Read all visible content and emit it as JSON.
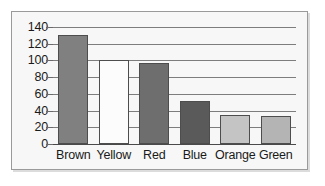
{
  "chart_data": {
    "type": "bar",
    "title": "",
    "subtitle": "",
    "xlabel": "",
    "ylabel": "",
    "categories": [
      "Brown",
      "Yellow",
      "Red",
      "Blue",
      "Orange",
      "Green"
    ],
    "values": [
      130,
      100,
      97,
      52,
      35,
      33
    ],
    "ylim": [
      0,
      140
    ],
    "yticks": [
      0,
      20,
      40,
      60,
      80,
      100,
      120,
      140
    ],
    "ytick_labels": [
      "0",
      "20",
      "40",
      "60",
      "80",
      "100",
      "120",
      "140"
    ],
    "grid": true,
    "grid_axis": "y",
    "legend": false,
    "legend_position": "none",
    "annotations": [],
    "bar_colors": [
      "#808080",
      "#fcfcfc",
      "#6e6e6e",
      "#5a5a5a",
      "#c4c4c4",
      "#b4b4b4"
    ],
    "bar_edge_color": "#4d4d4d",
    "series": [
      {
        "name": "",
        "values": [
          130,
          100,
          97,
          52,
          35,
          33
        ]
      }
    ]
  },
  "figure": {
    "frame_border_color": "#9a9a9a",
    "plot_background": "#f7f7f7",
    "gridline_color": "#7d7d7d",
    "axis_color": "#4a4a4a",
    "text_color": "#1a1a1a"
  }
}
